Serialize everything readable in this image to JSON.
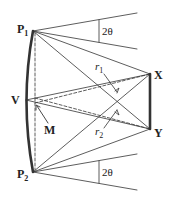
{
  "diagram": {
    "points": {
      "P1": {
        "label": "P",
        "sub": "1",
        "x": 33,
        "y": 31
      },
      "P2": {
        "label": "P",
        "sub": "2",
        "x": 33,
        "y": 172
      },
      "V": {
        "label": "V",
        "x": 26,
        "y": 100
      },
      "M": {
        "label": "M",
        "x": 35,
        "y": 103
      },
      "X": {
        "label": "X",
        "x": 150,
        "y": 74
      },
      "Y": {
        "label": "Y",
        "x": 150,
        "y": 129
      }
    },
    "labels": {
      "p1": "P",
      "p1_sub": "1",
      "p2": "P",
      "p2_sub": "2",
      "v": "V",
      "m": "M",
      "x": "X",
      "y": "Y",
      "r1": "r",
      "r1_sub": "1",
      "r2": "r",
      "r2_sub": "2",
      "angle_top": "2θ",
      "angle_bottom": "2θ"
    },
    "stroke_color": "#333333"
  }
}
